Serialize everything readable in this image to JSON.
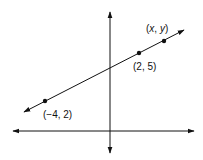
{
  "diagram": {
    "type": "coordinate-plane-line",
    "labels": {
      "p1": "(−4, 2)",
      "p2": "(2, 5)",
      "p3_x": "x",
      "p3_y": "y"
    },
    "points": [
      {
        "label": "(−4, 2)",
        "x": -4,
        "y": 2
      },
      {
        "label": "(2, 5)",
        "x": 2,
        "y": 5
      },
      {
        "label": "(x, y)",
        "x": "x",
        "y": "y"
      }
    ],
    "colors": {
      "stroke": "#111111",
      "background": "#ffffff"
    }
  }
}
